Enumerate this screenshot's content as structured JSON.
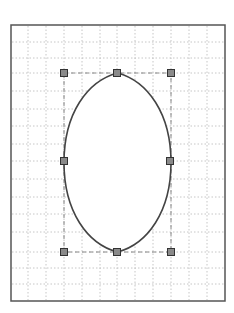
{
  "diagram": {
    "type": "bezier-shape-editor",
    "shape": "pointed-ellipse",
    "frame": {
      "x": 11,
      "y": 25,
      "width": 214,
      "height": 276,
      "stroke": "#555555"
    },
    "grid": {
      "color": "#b8b8b8",
      "vertical_x": [
        28,
        46,
        64,
        82,
        100,
        117,
        135,
        153,
        171,
        189,
        207
      ],
      "horizontal_y": [
        42,
        58,
        73,
        91,
        109,
        126,
        144,
        161,
        179,
        197,
        214,
        232,
        252,
        268,
        284
      ]
    },
    "bounding_box": {
      "x1": 64,
      "y1": 73,
      "x2": 171,
      "y2": 252,
      "stroke": "#888888"
    },
    "curve": {
      "stroke": "#444444",
      "fill": "#ffffff"
    },
    "handles": [
      {
        "name": "top-left",
        "x": 64,
        "y": 73
      },
      {
        "name": "top-center",
        "x": 117,
        "y": 73
      },
      {
        "name": "top-right",
        "x": 171,
        "y": 73
      },
      {
        "name": "middle-left",
        "x": 64,
        "y": 161
      },
      {
        "name": "middle-right",
        "x": 170,
        "y": 161
      },
      {
        "name": "bottom-left",
        "x": 64,
        "y": 252
      },
      {
        "name": "bottom-center",
        "x": 117,
        "y": 252
      },
      {
        "name": "bottom-right",
        "x": 171,
        "y": 252
      }
    ],
    "handle_style": {
      "size": 7,
      "fill": "#8a8a8a",
      "stroke": "#333333"
    }
  }
}
